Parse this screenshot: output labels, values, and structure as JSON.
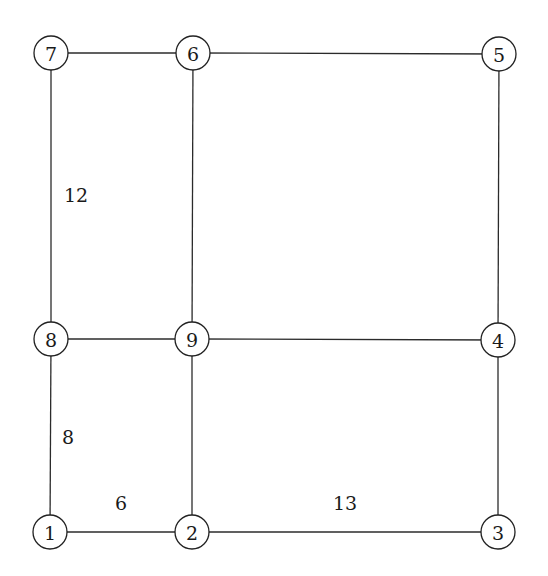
{
  "diagram": {
    "type": "graph",
    "node_radius": 17,
    "nodes": [
      {
        "id": "1",
        "label": "1",
        "x": 50,
        "y": 532
      },
      {
        "id": "2",
        "label": "2",
        "x": 192,
        "y": 532
      },
      {
        "id": "3",
        "label": "3",
        "x": 498,
        "y": 532
      },
      {
        "id": "4",
        "label": "4",
        "x": 498,
        "y": 340
      },
      {
        "id": "5",
        "label": "5",
        "x": 499,
        "y": 54
      },
      {
        "id": "6",
        "label": "6",
        "x": 193,
        "y": 53
      },
      {
        "id": "7",
        "label": "7",
        "x": 51,
        "y": 53
      },
      {
        "id": "8",
        "label": "8",
        "x": 51,
        "y": 339
      },
      {
        "id": "9",
        "label": "9",
        "x": 192,
        "y": 339
      }
    ],
    "edges": [
      {
        "from": "7",
        "to": "6"
      },
      {
        "from": "6",
        "to": "5"
      },
      {
        "from": "7",
        "to": "8",
        "weight": "12"
      },
      {
        "from": "6",
        "to": "9"
      },
      {
        "from": "5",
        "to": "4"
      },
      {
        "from": "8",
        "to": "9"
      },
      {
        "from": "9",
        "to": "4"
      },
      {
        "from": "8",
        "to": "1",
        "weight": "8"
      },
      {
        "from": "9",
        "to": "2"
      },
      {
        "from": "4",
        "to": "3"
      },
      {
        "from": "1",
        "to": "2",
        "weight": "6"
      },
      {
        "from": "2",
        "to": "3",
        "weight": "13"
      }
    ],
    "edge_labels": [
      {
        "text": "12",
        "x": 76,
        "y": 195
      },
      {
        "text": "8",
        "x": 68,
        "y": 437
      },
      {
        "text": "6",
        "x": 121,
        "y": 503
      },
      {
        "text": "13",
        "x": 345,
        "y": 503
      }
    ]
  }
}
